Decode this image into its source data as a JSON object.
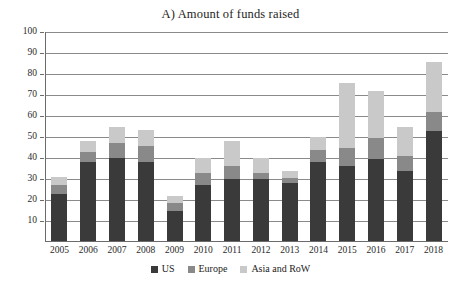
{
  "chart_data": {
    "type": "bar",
    "subtype": "stacked-vertical",
    "title": "A) Amount of funds raised",
    "xlabel": "",
    "ylabel": "",
    "ylim": [
      0,
      100
    ],
    "ytick_step": 10,
    "grid": true,
    "legend_position": "bottom-center",
    "categories": [
      "2005",
      "2006",
      "2007",
      "2008",
      "2009",
      "2010",
      "2011",
      "2012",
      "2013",
      "2014",
      "2015",
      "2016",
      "2017",
      "2018"
    ],
    "yticks": [
      "100",
      "90",
      "80",
      "70",
      "60",
      "50",
      "40",
      "30",
      "20",
      "10"
    ],
    "series": [
      {
        "name": "US",
        "color": "#3a3a3a",
        "values": [
          23,
          38,
          40,
          38,
          15,
          27,
          30,
          30,
          28,
          38,
          36,
          39.5,
          34,
          53
        ]
      },
      {
        "name": "Europe",
        "color": "#898989",
        "values": [
          4,
          5,
          7,
          7.5,
          3.5,
          6,
          6,
          3,
          2.5,
          6,
          9,
          10,
          7,
          9
        ]
      },
      {
        "name": "Asia and RoW",
        "color": "#c9c9c9",
        "values": [
          4,
          5,
          8,
          8,
          3.5,
          7,
          12,
          7,
          3.5,
          6,
          30.5,
          22.5,
          14,
          23.5
        ]
      }
    ],
    "totals": [
      31,
      48,
      55,
      53.5,
      22,
      40,
      48,
      40,
      34,
      50,
      75.5,
      72,
      55,
      85.5
    ]
  },
  "legend": {
    "items": [
      {
        "label": "US",
        "color": "#3a3a3a"
      },
      {
        "label": "Europe",
        "color": "#898989"
      },
      {
        "label": "Asia and RoW",
        "color": "#c9c9c9"
      }
    ]
  }
}
